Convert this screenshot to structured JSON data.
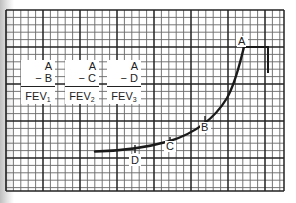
{
  "figure": {
    "type": "spirogram",
    "background_color": "#ffffff",
    "grid_color": "#333333",
    "curve_color": "#1a1a1a"
  },
  "labels": [
    {
      "numerator_top": "A",
      "numerator_bottom": "− B",
      "denominator": "FEV",
      "subscript": "1"
    },
    {
      "numerator_top": "A",
      "numerator_bottom": "− C",
      "denominator": "FEV",
      "subscript": "2"
    },
    {
      "numerator_top": "A",
      "numerator_bottom": "− D",
      "denominator": "FEV",
      "subscript": "3"
    }
  ],
  "points": {
    "A": "A",
    "B": "B",
    "C": "C",
    "D": "D"
  }
}
